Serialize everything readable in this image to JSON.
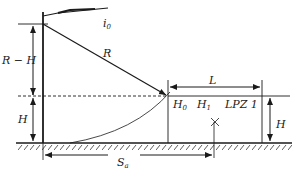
{
  "diagram": {
    "labels": {
      "current": "i",
      "current_sub": "0",
      "radius": "R",
      "r_minus_h": "R − H",
      "height_left": "H",
      "distance_L": "L",
      "h0": "H",
      "h0_sub": "0",
      "h1": "H",
      "h1_sub": "1",
      "zone": "LPZ 1",
      "height_right": "H",
      "distance_S": "S",
      "distance_S_sub": "a"
    },
    "colors": {
      "line": "#1a1a1a",
      "background": "#ffffff"
    }
  }
}
